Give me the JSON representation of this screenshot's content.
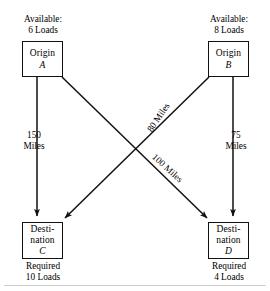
{
  "diagram": {
    "stroke_color": "#111111",
    "background_color": "#ffffff"
  },
  "nodes": [
    {
      "id": "A",
      "role": "origin",
      "kind_label": "Origin",
      "id_label": "A",
      "caption": "Available:\n6 Loads",
      "caption_position": "above",
      "quantity": 6,
      "quantity_unit": "Loads"
    },
    {
      "id": "B",
      "role": "origin",
      "kind_label": "Origin",
      "id_label": "B",
      "caption": "Available:\n8 Loads",
      "caption_position": "above",
      "quantity": 8,
      "quantity_unit": "Loads"
    },
    {
      "id": "C",
      "role": "destination",
      "kind_label": "Desti-\nnation",
      "id_label": "C",
      "caption": "Required\n10 Loads",
      "caption_position": "below",
      "quantity": 10,
      "quantity_unit": "Loads"
    },
    {
      "id": "D",
      "role": "destination",
      "kind_label": "Desti-\nnation",
      "id_label": "D",
      "caption": "Required\n4 Loads",
      "caption_position": "below",
      "quantity": 4,
      "quantity_unit": "Loads"
    }
  ],
  "edges": [
    {
      "from": "A",
      "to": "C",
      "label": "150\nMiles",
      "distance": 150,
      "distance_unit": "Miles",
      "orientation": "vertical"
    },
    {
      "from": "B",
      "to": "D",
      "label": "75\nMiles",
      "distance": 75,
      "distance_unit": "Miles",
      "orientation": "vertical"
    },
    {
      "from": "B",
      "to": "C",
      "label": "80 Miles",
      "distance": 80,
      "distance_unit": "Miles",
      "orientation": "diagonal"
    },
    {
      "from": "A",
      "to": "D",
      "label": "100 Miles",
      "distance": 100,
      "distance_unit": "Miles",
      "orientation": "diagonal"
    }
  ]
}
